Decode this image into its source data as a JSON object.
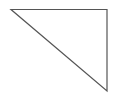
{
  "diagram": {
    "shape": "right-triangle",
    "stroke_color": "#555555",
    "fill_color": "#ffffff",
    "stroke_width": 1.2,
    "vertices": [
      [
        11,
        9.5
      ],
      [
        107,
        9.5
      ],
      [
        107,
        91
      ]
    ]
  }
}
